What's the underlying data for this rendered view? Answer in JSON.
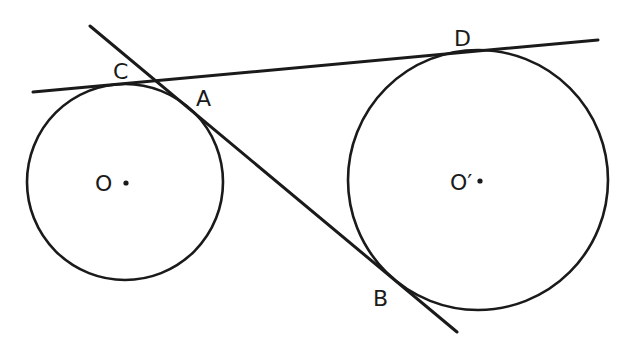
{
  "diagram": {
    "type": "geometry-two-circles-common-tangents",
    "stroke_color": "#1a1a1a",
    "background": "#ffffff",
    "circles": [
      {
        "name": "O",
        "label": "O",
        "cx": 125,
        "cy": 182,
        "r": 98
      },
      {
        "name": "O'",
        "label": "O′",
        "cx": 478,
        "cy": 180,
        "r": 130
      }
    ],
    "lines": [
      {
        "name": "CD",
        "x1": 33,
        "y1": 92,
        "x2": 598,
        "y2": 40,
        "description": "external common tangent touching circle O at C and circle O' at D"
      },
      {
        "name": "AB",
        "x1": 90,
        "y1": 26,
        "x2": 457,
        "y2": 332,
        "description": "internal common tangent touching circle O at A and circle O' at B"
      }
    ],
    "points": [
      {
        "label": "C",
        "x": 113,
        "y": 79
      },
      {
        "label": "A",
        "x": 196,
        "y": 106
      },
      {
        "label": "D",
        "x": 454,
        "y": 46
      },
      {
        "label": "B",
        "x": 373,
        "y": 306
      }
    ],
    "center_labels": [
      {
        "label": "O",
        "x": 95,
        "y": 191,
        "dot_x": 126,
        "dot_y": 183
      },
      {
        "label": "O′",
        "x": 450,
        "y": 190,
        "dot_x": 480,
        "dot_y": 181
      }
    ]
  }
}
